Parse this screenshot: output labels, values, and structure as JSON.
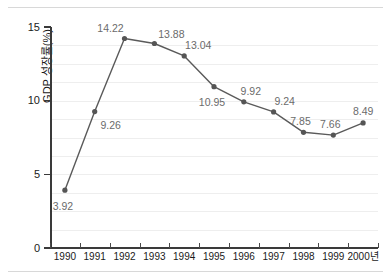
{
  "chart_data": {
    "type": "line",
    "title": "",
    "xlabel": "",
    "ylabel": "GDP 성장률(%)",
    "categories": [
      "1990",
      "1991",
      "1992",
      "1993",
      "1994",
      "1995",
      "1996",
      "1997",
      "1998",
      "1999",
      "2000년"
    ],
    "values": [
      3.92,
      9.26,
      14.22,
      13.88,
      13.04,
      10.95,
      9.92,
      9.24,
      7.85,
      7.66,
      8.49
    ],
    "point_labels": [
      "3.92",
      "9.26",
      "14.22",
      "13.88",
      "13.04",
      "10.95",
      "9.92",
      "9.24",
      "7.85",
      "7.66",
      "8.49"
    ],
    "ylim": [
      0,
      15
    ],
    "yticks": [
      0,
      5,
      10,
      15
    ],
    "ytick_labels": [
      "0",
      "5",
      "10",
      "15"
    ],
    "gridlines": [
      1.25,
      2.5,
      3.75,
      5,
      6.25,
      7.5,
      8.75,
      10,
      11.25,
      12.5,
      13.75
    ],
    "grid": true,
    "legend": "none",
    "series_color": "#5a5a5a",
    "marker_color": "#555555",
    "label_color": "#6b6b6b",
    "axis_color": "#3a3a3a",
    "grid_color": "#eeeeee",
    "background": "#ffffff",
    "label_offsets": [
      {
        "dx": -2,
        "dy": 16
      },
      {
        "dx": 16,
        "dy": 13
      },
      {
        "dx": -14,
        "dy": -11
      },
      {
        "dx": 17,
        "dy": -10
      },
      {
        "dx": 14,
        "dy": -11
      },
      {
        "dx": -2,
        "dy": 15
      },
      {
        "dx": 7,
        "dy": -11
      },
      {
        "dx": 11,
        "dy": -11
      },
      {
        "dx": -3,
        "dy": -11
      },
      {
        "dx": -3,
        "dy": -11
      },
      {
        "dx": 0,
        "dy": -12
      }
    ]
  }
}
